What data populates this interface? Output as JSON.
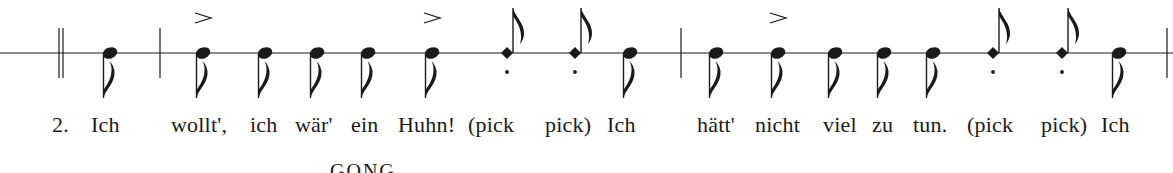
{
  "staff": {
    "line_y": 53,
    "x_start": 0,
    "x_end": 1173,
    "color": "#1a1a1a"
  },
  "barlines": [
    {
      "type": "double",
      "x": 59
    },
    {
      "type": "single",
      "x": 160
    },
    {
      "type": "single",
      "x": 681
    },
    {
      "type": "single",
      "x": 1167
    }
  ],
  "notes": [
    {
      "x": 110,
      "kind": "eighth",
      "accent": false
    },
    {
      "x": 203,
      "kind": "eighth",
      "accent": true
    },
    {
      "x": 265,
      "kind": "eighth",
      "accent": false
    },
    {
      "x": 317,
      "kind": "eighth",
      "accent": false
    },
    {
      "x": 368,
      "kind": "eighth",
      "accent": false
    },
    {
      "x": 432,
      "kind": "eighth",
      "accent": true
    },
    {
      "x": 507,
      "kind": "diamond",
      "accent": false
    },
    {
      "x": 575,
      "kind": "diamond",
      "accent": false
    },
    {
      "x": 630,
      "kind": "eighth",
      "accent": false
    },
    {
      "x": 716,
      "kind": "eighth",
      "accent": false
    },
    {
      "x": 778,
      "kind": "eighth",
      "accent": true
    },
    {
      "x": 835,
      "kind": "eighth",
      "accent": false
    },
    {
      "x": 884,
      "kind": "eighth",
      "accent": false
    },
    {
      "x": 933,
      "kind": "eighth",
      "accent": false
    },
    {
      "x": 993,
      "kind": "diamond",
      "accent": false
    },
    {
      "x": 1062,
      "kind": "diamond",
      "accent": false
    },
    {
      "x": 1119,
      "kind": "eighth",
      "accent": false
    }
  ],
  "lyrics": [
    {
      "x": 52,
      "text": "2."
    },
    {
      "x": 91,
      "text": "Ich"
    },
    {
      "x": 171,
      "text": "wollt',"
    },
    {
      "x": 250,
      "text": "ich"
    },
    {
      "x": 295,
      "text": "wär'"
    },
    {
      "x": 351,
      "text": "ein"
    },
    {
      "x": 398,
      "text": "Huhn!"
    },
    {
      "x": 468,
      "text": "(pick"
    },
    {
      "x": 545,
      "text": "pick)"
    },
    {
      "x": 607,
      "text": "Ich"
    },
    {
      "x": 697,
      "text": "hätt'"
    },
    {
      "x": 755,
      "text": "nicht"
    },
    {
      "x": 823,
      "text": "viel"
    },
    {
      "x": 872,
      "text": "zu"
    },
    {
      "x": 913,
      "text": "tun."
    },
    {
      "x": 967,
      "text": "(pick"
    },
    {
      "x": 1041,
      "text": "pick)"
    },
    {
      "x": 1101,
      "text": "Ich"
    }
  ],
  "caption": "GONG"
}
